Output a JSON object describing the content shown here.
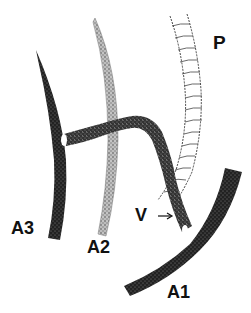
{
  "labels": {
    "p": "P",
    "a3": "A3",
    "a2": "A2",
    "a1": "A1",
    "v": "V"
  },
  "colors": {
    "vessel_dark": "#1a1a1a",
    "vessel_dotted": "#7a7a7a",
    "vessel_outline": "#555555",
    "text": "#111111",
    "background": "#ffffff"
  }
}
